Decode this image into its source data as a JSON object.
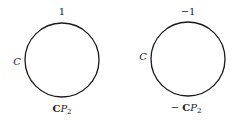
{
  "diagrams": [
    {
      "name": "left",
      "top_label": "1",
      "side_label": "C",
      "bottom_label_prefix": "",
      "bottom_label_bold": "C",
      "bottom_label_italic": "P",
      "bottom_label_sub": "2"
    },
    {
      "name": "right",
      "top_label": "−1",
      "side_label": "C",
      "bottom_label_prefix": "− ",
      "bottom_label_bold": "C",
      "bottom_label_italic": "P",
      "bottom_label_sub": "2"
    }
  ],
  "colors": {
    "stroke": "#1a1a1a",
    "text": "#222222"
  }
}
